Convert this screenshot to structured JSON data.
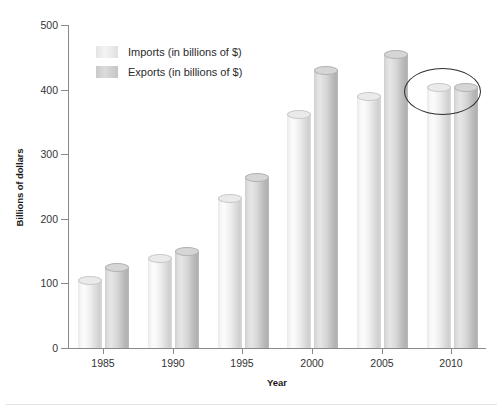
{
  "chart_data": {
    "type": "bar",
    "title": "",
    "subtitle": "",
    "xlabel": "Year",
    "ylabel": "Billions of dollars",
    "categories": [
      "1985",
      "1990",
      "1995",
      "2000",
      "2005",
      "2010"
    ],
    "series": [
      {
        "name": "Imports (in billions of $)",
        "values": [
          105,
          139,
          231,
          362,
          389,
          403
        ],
        "color": "#eeeeee"
      },
      {
        "name": "Exports (in billions of $)",
        "values": [
          124,
          150,
          264,
          430,
          454,
          403
        ],
        "color": "#cccccc"
      }
    ],
    "ylim": [
      0,
      500
    ],
    "yticks": [
      "0",
      "100",
      "200",
      "300",
      "400",
      "500"
    ],
    "grid": false,
    "legend_position": "top-left",
    "annotations": [
      {
        "type": "ellipse",
        "target": "2010",
        "label": ""
      }
    ]
  },
  "axes": {
    "y_title": "Billions of dollars",
    "x_title": "Year",
    "y_ticks": [
      "500",
      "400",
      "300",
      "200",
      "100",
      "0"
    ],
    "x_ticks": [
      "1985",
      "1990",
      "1995",
      "2000",
      "2005",
      "2010"
    ]
  },
  "legend": {
    "items": [
      {
        "label": "Imports (in billions of $)",
        "swatch": "imports-swatch"
      },
      {
        "label": "Exports (in billions of $)",
        "swatch": "exports-swatch"
      }
    ]
  }
}
